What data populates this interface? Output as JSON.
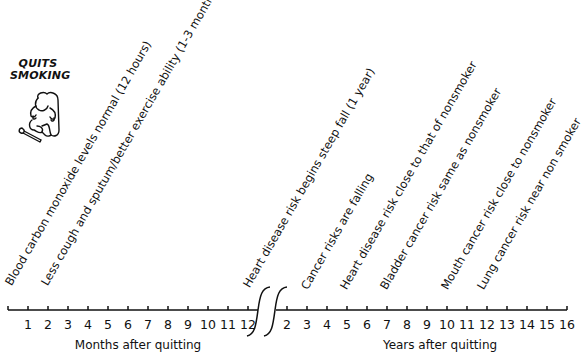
{
  "title": [
    "QUITS",
    "SMOKING"
  ],
  "figure_icon": "person-breaking-cigarette-icon",
  "months_axis": {
    "label": "Months after quitting",
    "ticks": [
      "1",
      "2",
      "3",
      "4",
      "5",
      "6",
      "7",
      "8",
      "9",
      "10",
      "11",
      "12"
    ]
  },
  "years_axis": {
    "label": "Years after quitting",
    "ticks": [
      "2",
      "3",
      "4",
      "5",
      "6",
      "7",
      "8",
      "9",
      "10",
      "11",
      "12",
      "13",
      "14",
      "15",
      "16"
    ]
  },
  "events": [
    {
      "text": "Blood carbon monoxide levels normal (12 hours)"
    },
    {
      "text": "Less cough and sputum/better exercise ability (1-3 months)"
    },
    {
      "text": "Heart disease risk begins steep fall (1 year)"
    },
    {
      "text": "Cancer risks are falling"
    },
    {
      "text": "Heart disease risk close to that of nonsmoker"
    },
    {
      "text": "Bladder cancer risk same as nonsmoker"
    },
    {
      "text": "Mouth cancer risk close to nonsmoker"
    },
    {
      "text": "Lung cancer risk near non smoker"
    }
  ]
}
